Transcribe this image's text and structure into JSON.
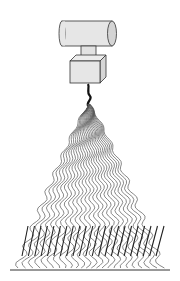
{
  "figure": {
    "components": [
      {
        "name": "cylinder-reservoir",
        "label": ""
      },
      {
        "name": "connector-neck",
        "label": ""
      },
      {
        "name": "cube-nozzle-block",
        "label": ""
      },
      {
        "name": "fiber-jet",
        "label": ""
      },
      {
        "name": "wavy-fiber-fan",
        "label": ""
      },
      {
        "name": "aligned-straight-fibers",
        "label": ""
      },
      {
        "name": "substrate-line",
        "label": ""
      }
    ],
    "fiber_count": 24,
    "aligned_fiber_count": 22,
    "colors": {
      "body_fill": "#e6e6e6",
      "body_shade": "#cfcfcf",
      "outline": "#333333",
      "fiber": "#555555",
      "straight_fiber": "#222222",
      "background": "#ffffff"
    },
    "caption_fragment": ""
  }
}
